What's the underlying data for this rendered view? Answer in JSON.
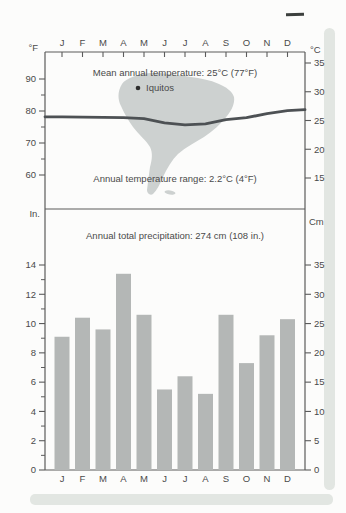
{
  "figure": {
    "annotations": {
      "mean_temp": "Mean annual temperature: 25°C (77°F)",
      "station": "Iquitos",
      "temp_range": "Annual temperature range: 2.2°C (4°F)",
      "precip_total": "Annual total precipitation: 274 cm (108 in.)"
    }
  },
  "chart_data": [
    {
      "type": "line",
      "title": "Mean annual temperature: 25°C (77°F)",
      "categories": [
        "J",
        "F",
        "M",
        "A",
        "M",
        "J",
        "J",
        "A",
        "S",
        "O",
        "N",
        "D"
      ],
      "series": [
        {
          "name": "Mean monthly temperature (°F)",
          "values": [
            78.2,
            78.1,
            78.0,
            77.9,
            77.6,
            76.3,
            75.7,
            76.0,
            77.3,
            77.9,
            79.2,
            80.1
          ]
        }
      ],
      "y_axis_left": {
        "unit": "°F",
        "ticks": [
          90,
          80,
          70,
          60
        ],
        "minor_ticks": [
          85,
          75,
          65
        ]
      },
      "y_axis_right": {
        "unit": "°C",
        "ticks": [
          35,
          30,
          25,
          20,
          15
        ]
      },
      "annotations": [
        "Mean annual temperature: 25°C (77°F)",
        "Iquitos",
        "Annual temperature range: 2.2°C (4°F)"
      ],
      "grid": false,
      "legend": "none"
    },
    {
      "type": "bar",
      "title": "Annual total precipitation: 274 cm (108 in.)",
      "categories": [
        "J",
        "F",
        "M",
        "A",
        "M",
        "J",
        "J",
        "A",
        "S",
        "O",
        "N",
        "D"
      ],
      "series": [
        {
          "name": "Monthly precipitation (in.)",
          "values": [
            9.1,
            10.4,
            9.6,
            13.4,
            10.6,
            5.5,
            6.4,
            5.2,
            10.6,
            7.3,
            9.2,
            10.3
          ]
        }
      ],
      "y_axis_left": {
        "unit": "In.",
        "ticks": [
          14,
          12,
          10,
          8,
          6,
          4,
          2,
          0
        ],
        "minor_ticks": [
          13,
          11,
          9,
          7,
          5,
          3,
          1
        ],
        "range": [
          0,
          14
        ]
      },
      "y_axis_right": {
        "unit": "Cm",
        "ticks": [
          35,
          30,
          25,
          20,
          15,
          10,
          5,
          0
        ],
        "range": [
          0,
          35
        ]
      },
      "grid": false,
      "legend": "none"
    }
  ],
  "colors": {
    "map_fill": "#cdd1d0",
    "bar_fill": "#b4b7b6",
    "temp_line": "#4d5154",
    "axis_line": "#5b5b5b",
    "tick_label": "#4a4a4a",
    "station_dot": "#2d2d2d",
    "page_edge": "#e2e6e2",
    "artifact": "#3c403e"
  }
}
